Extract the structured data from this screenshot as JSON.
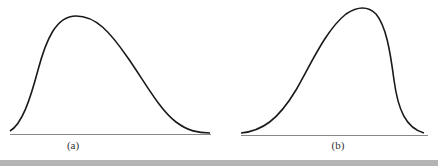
{
  "panels": [
    {
      "id": "a",
      "label": "(a)",
      "description": "right-skewed unimodal distribution curve"
    },
    {
      "id": "b",
      "label": "(b)",
      "description": "left-skewed unimodal distribution curve"
    }
  ],
  "colors": {
    "curve": "#1a1a1a",
    "baseline": "#888888",
    "bottom_bar": "#b4b4b4"
  }
}
